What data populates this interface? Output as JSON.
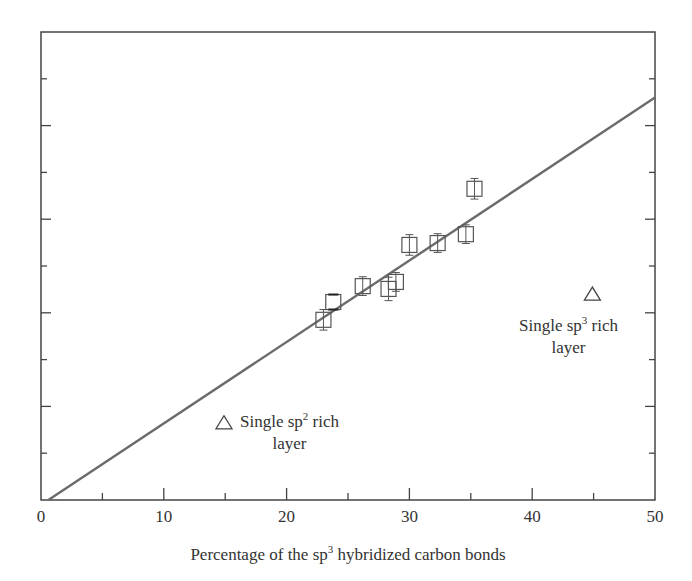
{
  "chart_data": {
    "type": "scatter",
    "title": "",
    "xlabel": "Percentage of the sp3 hybridized carbon bonds",
    "xlabel_parts": {
      "pre": "Percentage of the sp",
      "sup": "3",
      "post": " hybridized carbon bonds"
    },
    "ylabel": "",
    "xlim": [
      0,
      50
    ],
    "ylim": [
      0,
      10
    ],
    "x_ticks_major": [
      0,
      10,
      20,
      30,
      40,
      50
    ],
    "x_ticks_minor": [
      5,
      15,
      25,
      35,
      45
    ],
    "x_tick_labels": [
      "0",
      "10",
      "20",
      "30",
      "40",
      "50"
    ],
    "y_ticks_major": [
      2,
      4,
      6,
      8
    ],
    "y_ticks_minor": [
      1,
      3,
      5,
      7,
      9
    ],
    "y_tick_labels": [],
    "grid": false,
    "legend": null,
    "series": [
      {
        "name": "Multilayer samples",
        "marker": "square-with-errorbar",
        "x": [
          23.0,
          23.8,
          26.2,
          28.3,
          28.9,
          30.0,
          32.3,
          34.6,
          35.3
        ],
        "y": [
          3.85,
          4.23,
          4.57,
          4.51,
          4.66,
          5.45,
          5.49,
          5.68,
          6.65
        ],
        "err": [
          0.22,
          0,
          0.2,
          0.25,
          0.2,
          0.22,
          0.2,
          0.2,
          0.22
        ]
      },
      {
        "name": "Single layers",
        "marker": "triangle",
        "x": [
          14.9,
          44.9
        ],
        "y": [
          1.65,
          4.4
        ]
      },
      {
        "name": "Linear fit",
        "type": "line",
        "x": [
          0.6,
          50
        ],
        "y": [
          0,
          8.6
        ],
        "color": "#666666"
      }
    ],
    "annotations": [
      {
        "text": "Single sp2 rich layer",
        "pre": "Single sp",
        "sup": "2",
        "post": " rich",
        "line2": "layer",
        "x": 14.9,
        "y": 1.65
      },
      {
        "text": "Single sp3 rich layer",
        "pre": "Single sp",
        "sup": "3",
        "post": " rich",
        "line2": "layer",
        "x": 44.9,
        "y": 4.4
      }
    ]
  },
  "colors": {
    "axis": "#444444",
    "fit_line": "#6b6b6b",
    "marker": "#555555"
  }
}
